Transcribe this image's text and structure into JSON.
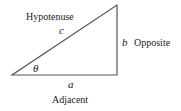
{
  "diagram": {
    "type": "right-triangle",
    "stroke_color": "#555555",
    "vertices": {
      "angle_vertex": [
        12,
        75
      ],
      "right_angle_vertex": [
        117,
        75
      ],
      "top_vertex": [
        117,
        5
      ]
    },
    "labels": {
      "hypotenuse": "Hypotenuse",
      "hypotenuse_var": "c",
      "opposite": "Opposite",
      "opposite_var": "b",
      "adjacent": "Adjacent",
      "adjacent_var": "a",
      "angle": "θ"
    }
  }
}
